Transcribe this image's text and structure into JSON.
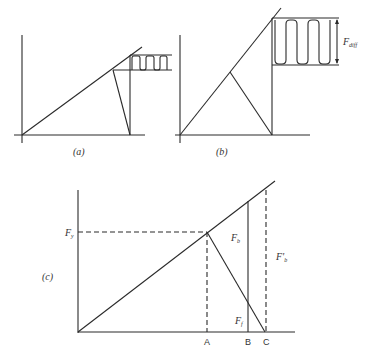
{
  "panels": {
    "a": {
      "caption": "(a)",
      "description": "Linear rise to peak, drop to axis, with small oscillating (zigzag) region between two horizontal lines"
    },
    "b": {
      "caption": "(b)",
      "description": "Steeper linear rise, triangular drop, large oscillation band of height F_diff",
      "label_diff": {
        "main": "F",
        "sub": "diff"
      }
    },
    "c": {
      "caption": "(c)",
      "labels": {
        "fy": {
          "main": "F",
          "sub": "y"
        },
        "fb": {
          "main": "F",
          "sub": "b"
        },
        "fb_prime": {
          "main": "F'",
          "sub": "b"
        },
        "ff": {
          "main": "F",
          "sub": "f"
        }
      },
      "x_ticks": [
        "A",
        "B",
        "C"
      ]
    }
  }
}
